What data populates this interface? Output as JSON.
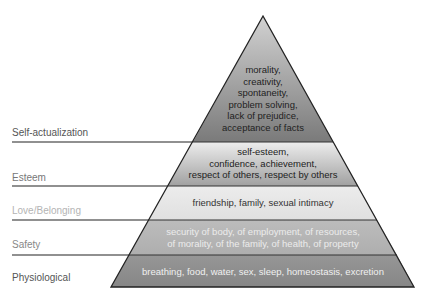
{
  "levels": [
    {
      "name": "Self-actualization",
      "label_color": "#555555",
      "text_color": "#222222",
      "lines": [
        "morality,",
        "creativity,",
        "spontaneity,",
        "problem solving,",
        "lack of prejudice,",
        "acceptance of facts"
      ],
      "fill_top": "#d0d0d0",
      "fill_bottom": "#7c7c7c"
    },
    {
      "name": "Esteem",
      "label_color": "#777777",
      "text_color": "#222222",
      "lines": [
        "self-esteem,",
        "confidence, achievement,",
        "respect of others, respect by others"
      ],
      "fill_top": "#ececec",
      "fill_bottom": "#a2a2a2"
    },
    {
      "name": "Love/Belonging",
      "label_color": "#b4b4b4",
      "text_color": "#333333",
      "lines": [
        "friendship, family, sexual intimacy"
      ],
      "fill_top": "#eaeaea",
      "fill_bottom": "#e2e2e2"
    },
    {
      "name": "Safety",
      "label_color": "#888888",
      "text_color": "#e8e8e8",
      "lines": [
        "security of body, of employment, of resources,",
        "of morality, of the family, of health, of property"
      ],
      "fill_top": "#b8b8b8",
      "fill_bottom": "#b0b0b0"
    },
    {
      "name": "Physiological",
      "label_color": "#555555",
      "text_color": "#efefef",
      "lines": [
        "breathing, food, water, sex, sleep, homeostasis, excretion"
      ],
      "fill_top": "#929292",
      "fill_bottom": "#888888"
    }
  ]
}
